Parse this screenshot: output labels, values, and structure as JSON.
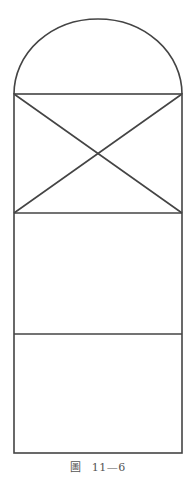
{
  "figure": {
    "caption_prefix": "圖",
    "caption_number": "11—6",
    "stroke_color": "#444444",
    "background": "#ffffff"
  },
  "diagram": {
    "type": "window-elevation",
    "parts": [
      {
        "name": "semicircular-arch-top",
        "shape": "half-ellipse"
      },
      {
        "name": "upper-panel",
        "shape": "rectangle-with-x-cross"
      },
      {
        "name": "middle-panel",
        "shape": "rectangle"
      },
      {
        "name": "lower-panel",
        "shape": "rectangle"
      }
    ]
  }
}
